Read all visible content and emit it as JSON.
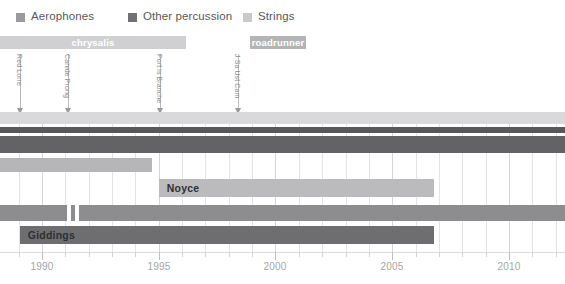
{
  "legend": {
    "items": [
      {
        "label": "Aerophones",
        "color": "#9a9a9c",
        "x": 16,
        "icon": "legend-swatch-icon"
      },
      {
        "label": "Other percussion",
        "color": "#717173",
        "x": 128,
        "icon": "legend-swatch-icon"
      },
      {
        "label": "Strings",
        "color": "#c9c9cb",
        "x": 243,
        "icon": "legend-swatch-icon"
      }
    ]
  },
  "works": [
    {
      "label": "chrysalis",
      "x": 0,
      "width": 186,
      "color": "#d0d0d2"
    },
    {
      "label": "roadrunner",
      "x": 250,
      "width": 56,
      "color": "#b4b4b6"
    }
  ],
  "annotations": [
    {
      "label": "Red Lorre",
      "x": 20
    },
    {
      "label": "Cahide Prong",
      "x": 68
    },
    {
      "label": "Port is Branche",
      "x": 160
    },
    {
      "label": "J Sa Ust Cam",
      "x": 238
    }
  ],
  "chart_data": {
    "type": "bar",
    "orientation": "horizontal-timeline",
    "title": "",
    "xlabel": "",
    "ylabel": "",
    "xlim": [
      1988.2,
      2012.4
    ],
    "grid": true,
    "legend_position": "top-left",
    "axis": {
      "tick_labels": [
        "1990",
        "1995",
        "2000",
        "2005",
        "2010"
      ],
      "major_ticks": [
        1990,
        1995,
        2000,
        2005,
        2010
      ],
      "minor_tick_step": 1
    },
    "tracks": [
      {
        "name": "strings-top",
        "category": "Strings",
        "color": "#d9d9db",
        "y": 0,
        "height": 12,
        "segments": [
          {
            "start": 1988.2,
            "end": 2012.4,
            "hatched": false,
            "label": ""
          }
        ]
      },
      {
        "name": "other-percussion-thin",
        "category": "Other percussion",
        "color": "#58585a",
        "y": 15,
        "height": 6,
        "segments": [
          {
            "start": 1988.2,
            "end": 2012.4,
            "hatched": false,
            "label": ""
          }
        ]
      },
      {
        "name": "other-percussion-main",
        "category": "Other percussion",
        "color": "#636365",
        "y": 24,
        "height": 17,
        "segments": [
          {
            "start": 1988.2,
            "end": 2012.4,
            "hatched": true,
            "label": ""
          }
        ]
      },
      {
        "name": "strings-mid",
        "category": "Strings",
        "color": "#b6b6b8",
        "y": 46,
        "height": 14,
        "segments": [
          {
            "start": 1988.2,
            "end": 1994.7,
            "hatched": false,
            "label": ""
          }
        ]
      },
      {
        "name": "noyce-track",
        "category": "Strings",
        "color": "#bbbbbd",
        "y": 67,
        "height": 18,
        "segments": [
          {
            "start": 1995.0,
            "end": 2006.8,
            "hatched": false,
            "label": "Noyce"
          }
        ]
      },
      {
        "name": "aerophones-track",
        "category": "Aerophones",
        "color": "#8d8d8f",
        "y": 93,
        "height": 16,
        "segments": [
          {
            "start": 1988.2,
            "end": 1991.05,
            "hatched": false,
            "label": ""
          },
          {
            "start": 1991.25,
            "end": 1991.4,
            "hatched": false,
            "label": ""
          },
          {
            "start": 1991.6,
            "end": 2012.4,
            "hatched": false,
            "label": ""
          }
        ]
      },
      {
        "name": "giddings-track",
        "category": "Other percussion",
        "color": "#6e6e70",
        "y": 114,
        "height": 18,
        "segments": [
          {
            "start": 1989.05,
            "end": 2006.8,
            "hatched": true,
            "label": "Giddings"
          }
        ]
      }
    ]
  }
}
